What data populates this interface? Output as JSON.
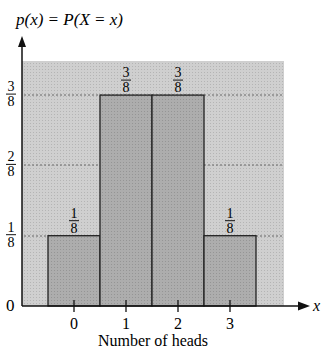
{
  "chart_data": {
    "type": "bar",
    "title": "p(x) = P(X = x)",
    "xlabel": "Number of heads",
    "ylabel": "p(x) = P(X = x)",
    "x_axis_symbol": "x",
    "categories": [
      "0",
      "1",
      "2",
      "3"
    ],
    "values": [
      0.125,
      0.375,
      0.375,
      0.125
    ],
    "value_labels": [
      {
        "num": "1",
        "den": "8"
      },
      {
        "num": "3",
        "den": "8"
      },
      {
        "num": "3",
        "den": "8"
      },
      {
        "num": "1",
        "den": "8"
      }
    ],
    "y_ticks": [
      {
        "label": "0",
        "value": 0
      },
      {
        "num": "1",
        "den": "8",
        "value": 0.125
      },
      {
        "num": "2",
        "den": "8",
        "value": 0.25
      },
      {
        "num": "3",
        "den": "8",
        "value": 0.375
      }
    ],
    "ylim": [
      0,
      0.43
    ],
    "grid": "dotted horizontal at 1/8, 2/8, 3/8",
    "legend": "none",
    "colors": {
      "background_shade": "#c8c8c8",
      "bar_fill": "#a9a9a9",
      "bar_edge": "#222222",
      "axis": "#111111",
      "grid": "#666666"
    }
  }
}
